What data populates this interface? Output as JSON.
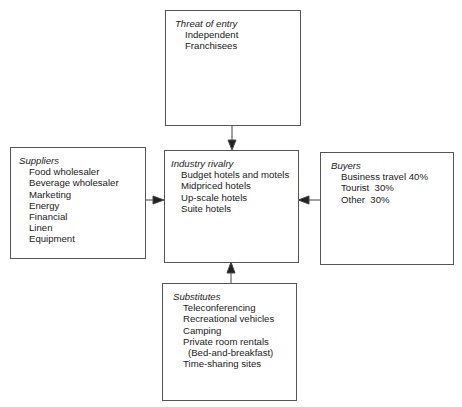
{
  "diagram": {
    "type": "five-forces",
    "boxes": {
      "threat_of_entry": {
        "title": "Threat of entry",
        "items": [
          "Independent",
          "Franchisees"
        ]
      },
      "suppliers": {
        "title": "Suppliers",
        "items": [
          "Food wholesaler",
          "Beverage wholesaler",
          "Marketing",
          "Energy",
          "Financial",
          "Linen",
          "Equipment"
        ]
      },
      "industry_rivalry": {
        "title": "Industry rivalry",
        "items": [
          "Budget hotels and motels",
          "Midpriced hotels",
          "Up-scale hotels",
          "Suite hotels"
        ]
      },
      "buyers": {
        "title": "Buyers",
        "items": [
          "Business travel 40%",
          "Tourist  30%",
          "Other  30%"
        ]
      },
      "substitutes": {
        "title": "Substitutes",
        "items": [
          "Teleconferencing",
          "Recreational vehicles",
          "Camping",
          "Private room rentals",
          "(Bed-and-breakfast)",
          "Time-sharing sites"
        ]
      }
    },
    "arrows": [
      {
        "from": "threat_of_entry",
        "to": "industry_rivalry",
        "direction": "down"
      },
      {
        "from": "suppliers",
        "to": "industry_rivalry",
        "direction": "right"
      },
      {
        "from": "buyers",
        "to": "industry_rivalry",
        "direction": "left"
      },
      {
        "from": "substitutes",
        "to": "industry_rivalry",
        "direction": "up"
      }
    ],
    "colors": {
      "line": "#555555",
      "text": "#1a1a1a",
      "background": "#ffffff"
    }
  }
}
